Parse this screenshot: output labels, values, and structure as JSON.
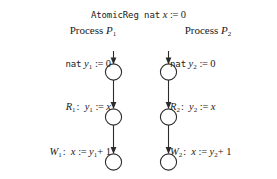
{
  "figure": {
    "title": {
      "keyword": "AtomicReg",
      "type": "nat",
      "var": "x",
      "assign": ":=",
      "value": "0"
    },
    "processes": [
      {
        "id": "P1",
        "heading_word": "Process",
        "heading_name": "P",
        "heading_sub": "1",
        "side": "left",
        "states": [
          "s0",
          "s1",
          "s2"
        ],
        "transitions": [
          {
            "name": "init",
            "label_kind": "declaration",
            "type": "nat",
            "var": "y",
            "var_sub": "1",
            "assign": ":=",
            "expr": "0",
            "text": "nat y1 := 0"
          },
          {
            "name": "R",
            "name_sub": "1",
            "label_kind": "operation",
            "var": "y",
            "var_sub": "1",
            "assign": ":=",
            "expr": "x",
            "text": "R1 : y1 := x"
          },
          {
            "name": "W",
            "name_sub": "1",
            "label_kind": "operation",
            "var": "x",
            "var_sub": "",
            "assign": ":=",
            "expr": "y1 + 1",
            "expr_base": "y",
            "expr_sub": "1",
            "expr_tail": "+ 1",
            "text": "W1 : x := y1 + 1"
          }
        ]
      },
      {
        "id": "P2",
        "heading_word": "Process",
        "heading_name": "P",
        "heading_sub": "2",
        "side": "right",
        "states": [
          "s0",
          "s1",
          "s2"
        ],
        "transitions": [
          {
            "name": "init",
            "label_kind": "declaration",
            "type": "nat",
            "var": "y",
            "var_sub": "2",
            "assign": ":=",
            "expr": "0",
            "text": "nat y2 := 0"
          },
          {
            "name": "R",
            "name_sub": "2",
            "label_kind": "operation",
            "var": "y",
            "var_sub": "2",
            "assign": ":=",
            "expr": "x",
            "text": "R2 : y2 := x"
          },
          {
            "name": "W",
            "name_sub": "2",
            "label_kind": "operation",
            "var": "x",
            "var_sub": "",
            "assign": ":=",
            "expr": "y2 + 1",
            "expr_base": "y",
            "expr_sub": "2",
            "expr_tail": "+ 1",
            "text": "W2 : x := y2 + 1"
          }
        ]
      }
    ],
    "colors": {
      "ink": "#1a1a1a",
      "background": "#ffffff",
      "stroke": "#2b2b2b"
    }
  }
}
